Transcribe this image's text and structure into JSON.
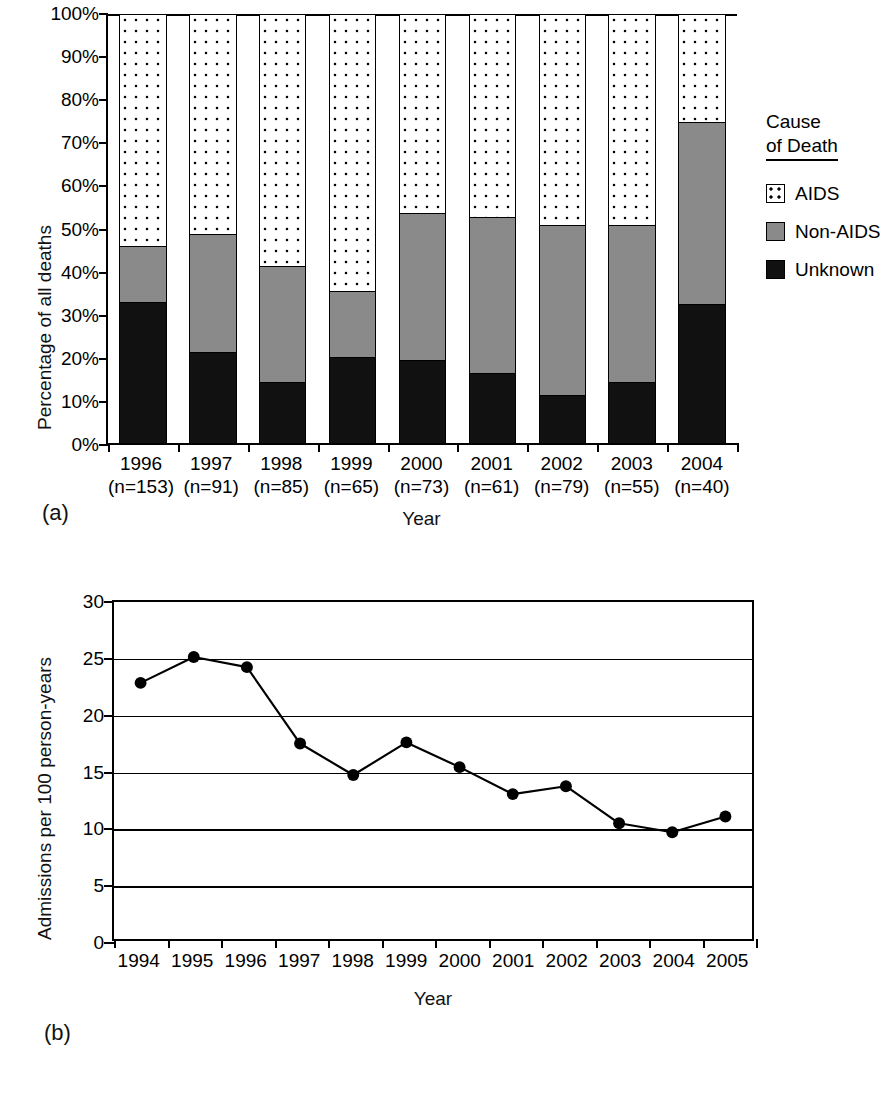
{
  "chart_data": [
    {
      "type": "bar",
      "panel": "(a)",
      "stacked": true,
      "title": "",
      "xlabel": "Year",
      "ylabel": "Percentage of all deaths",
      "ylim": [
        0,
        100
      ],
      "yticks": [
        "0%",
        "10%",
        "20%",
        "30%",
        "40%",
        "50%",
        "60%",
        "70%",
        "80%",
        "90%",
        "100%"
      ],
      "grid": false,
      "legend_position": "right",
      "legend_title_line1": "Cause",
      "legend_title_line2": "of Death",
      "categories": [
        "1996",
        "1997",
        "1998",
        "1999",
        "2000",
        "2001",
        "2002",
        "2003",
        "2004"
      ],
      "category_sublabels": [
        "(n=153)",
        "(n=91)",
        "(n=85)",
        "(n=65)",
        "(n=73)",
        "(n=61)",
        "(n=79)",
        "(n=55)",
        "(n=40)"
      ],
      "series": [
        {
          "name": "Unknown",
          "fill": "solid-black",
          "color": "#111111",
          "values": [
            32.7,
            20.9,
            14.0,
            19.8,
            19.1,
            16.1,
            11.0,
            14.1,
            32.2
          ]
        },
        {
          "name": "Non-AIDS",
          "fill": "solid-gray",
          "color": "#8a8a8a",
          "values": [
            13.0,
            27.5,
            27.0,
            15.4,
            34.2,
            36.3,
            39.5,
            36.4,
            42.3
          ]
        },
        {
          "name": "AIDS",
          "fill": "dotted-white",
          "color": "#ffffff",
          "values": [
            54.3,
            51.6,
            59.0,
            64.8,
            46.7,
            47.6,
            49.5,
            49.5,
            25.5
          ]
        }
      ],
      "cumulative_tops": {
        "unknown": [
          32.7,
          20.9,
          14.0,
          19.8,
          19.1,
          16.1,
          11.0,
          14.1,
          32.2
        ],
        "nonaids": [
          45.7,
          48.4,
          41.0,
          35.2,
          53.3,
          52.4,
          50.5,
          50.5,
          74.5
        ]
      }
    },
    {
      "type": "line",
      "panel": "(b)",
      "title": "",
      "xlabel": "Year",
      "ylabel": "Admissions per 100 person-years",
      "ylim": [
        0,
        30
      ],
      "yticks": [
        "0",
        "5",
        "10",
        "15",
        "20",
        "25",
        "30"
      ],
      "grid": true,
      "legend_position": "top-right",
      "x": [
        "1994",
        "1995",
        "1996",
        "1997",
        "1998",
        "1999",
        "2000",
        "2001",
        "2002",
        "2003",
        "2004",
        "2005"
      ],
      "series": [
        {
          "name": "All Causes",
          "marker": "filled-circle",
          "color": "#000000",
          "values": [
            22.8,
            25.1,
            24.2,
            17.4,
            14.6,
            17.5,
            15.3,
            12.9,
            13.6,
            10.3,
            9.5,
            10.9
          ]
        }
      ]
    }
  ],
  "panel_a": {
    "label": "(a)",
    "ylabel": "Percentage of all deaths",
    "xlabel": "Year",
    "yticks": [
      "100%",
      "90%",
      "80%",
      "70%",
      "60%",
      "50%",
      "40%",
      "30%",
      "20%",
      "10%",
      "0%"
    ],
    "years": [
      "1996",
      "1997",
      "1998",
      "1999",
      "2000",
      "2001",
      "2002",
      "2003",
      "2004"
    ],
    "counts": [
      "(n=153)",
      "(n=91)",
      "(n=85)",
      "(n=65)",
      "(n=73)",
      "(n=61)",
      "(n=79)",
      "(n=55)",
      "(n=40)"
    ],
    "legend": {
      "title_line1": "Cause",
      "title_line2": "of Death",
      "items": [
        {
          "label": "AIDS"
        },
        {
          "label": "Non-AIDS"
        },
        {
          "label": "Unknown"
        }
      ]
    }
  },
  "panel_b": {
    "label": "(b)",
    "ylabel": "Admissions per 100 person-years",
    "xlabel": "Year",
    "yticks": [
      "30",
      "25",
      "20",
      "15",
      "10",
      "5",
      "0"
    ],
    "years": [
      "1994",
      "1995",
      "1996",
      "1997",
      "1998",
      "1999",
      "2000",
      "2001",
      "2002",
      "2003",
      "2004",
      "2005"
    ],
    "legend": {
      "label": "All Causes"
    }
  },
  "colors": {
    "unknown": "#111111",
    "nonaids": "#8a8a8a",
    "aids": "#ffffff",
    "line": "#000000",
    "axis": "#000000"
  }
}
